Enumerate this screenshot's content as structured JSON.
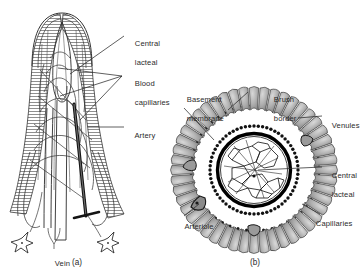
{
  "figure": {
    "title_visible": false,
    "background_color": "#ffffff",
    "ink_color": "#1a1a1a",
    "epithelium_fill": "#b4b4b4",
    "ring_color": "#000000",
    "panels": [
      {
        "id": "a",
        "caption": "(a)",
        "description": "longitudinal view of an intestinal villus",
        "labels": [
          {
            "name": "central-lacteal",
            "lines": [
              "Central",
              "lacteal"
            ]
          },
          {
            "name": "blood-capillaries",
            "lines": [
              "Blood",
              "capillaries"
            ]
          },
          {
            "name": "artery",
            "lines": [
              "Artery"
            ]
          },
          {
            "name": "vein",
            "lines": [
              "Vein"
            ]
          }
        ]
      },
      {
        "id": "b",
        "caption": "(b)",
        "description": "cross-section of an intestinal villus",
        "labels": [
          {
            "name": "basement-membrane",
            "lines": [
              "Basement",
              "membrane"
            ]
          },
          {
            "name": "brush-border",
            "lines": [
              "Brush",
              "border"
            ]
          },
          {
            "name": "venules",
            "lines": [
              "Venules"
            ]
          },
          {
            "name": "central-lacteal",
            "lines": [
              "Central",
              "lacteal"
            ]
          },
          {
            "name": "capillaries",
            "lines": [
              "Capillaries"
            ]
          },
          {
            "name": "arteriole",
            "lines": [
              "Arteriole"
            ]
          }
        ]
      }
    ]
  },
  "panel_a": {
    "caption": "(a)",
    "label_central_lacteal_1": "Central",
    "label_central_lacteal_2": "lacteal",
    "label_blood_capillaries_1": "Blood",
    "label_blood_capillaries_2": "capillaries",
    "label_artery": "Artery",
    "label_vein": "Vein"
  },
  "panel_b": {
    "caption": "(b)",
    "label_basement_membrane_1": "Basement",
    "label_basement_membrane_2": "membrane",
    "label_brush_border_1": "Brush",
    "label_brush_border_2": "border",
    "label_venules": "Venules",
    "label_central_lacteal_1": "Central",
    "label_central_lacteal_2": "lacteal",
    "label_capillaries": "Capillaries",
    "label_arteriole": "Arteriole"
  }
}
